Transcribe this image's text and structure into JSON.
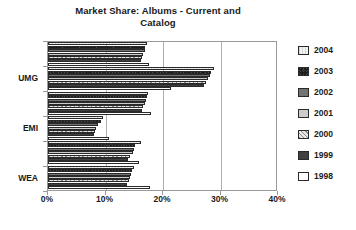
{
  "chart_data": {
    "type": "bar",
    "orientation": "horizontal",
    "title": "Market Share: Albums - Current and Catalog",
    "title_line1": "Market Share: Albums - Current and",
    "title_line2": "Catalog",
    "xlabel": "",
    "ylabel": "",
    "xlim": [
      0,
      40
    ],
    "xticks": [
      0,
      10,
      20,
      30,
      40
    ],
    "xticklabels": [
      "0%",
      "10%",
      "20%",
      "30%",
      "40%"
    ],
    "grid": true,
    "legend_position": "right",
    "categories": [
      "",
      "UMG",
      "",
      "EMI",
      "",
      "WEA"
    ],
    "visible_category_labels": [
      "UMG",
      "EMI",
      "WEA"
    ],
    "series": [
      {
        "name": "2004",
        "values": [
          17.2,
          28.9,
          17.4,
          9.6,
          16.1,
          14.9
        ]
      },
      {
        "name": "2003",
        "values": [
          16.9,
          28.3,
          17.3,
          9.2,
          15.2,
          14.6
        ]
      },
      {
        "name": "2002",
        "values": [
          16.8,
          28.1,
          17.1,
          8.7,
          15.0,
          14.4
        ]
      },
      {
        "name": "2001",
        "values": [
          16.6,
          27.9,
          16.8,
          8.4,
          14.7,
          14.2
        ]
      },
      {
        "name": "2000",
        "values": [
          16.4,
          27.5,
          16.6,
          8.2,
          14.3,
          14.0
        ]
      },
      {
        "name": "1999",
        "values": [
          16.1,
          27.2,
          16.3,
          8.0,
          13.9,
          13.8
        ]
      },
      {
        "name": "1998",
        "values": [
          17.6,
          21.4,
          17.9,
          10.6,
          15.8,
          17.8
        ]
      }
    ]
  },
  "legend": {
    "items": [
      {
        "label": "2004",
        "swatch": "swatch-2004"
      },
      {
        "label": "2003",
        "swatch": "swatch-2003"
      },
      {
        "label": "2002",
        "swatch": "swatch-2002"
      },
      {
        "label": "2001",
        "swatch": "swatch-2001"
      },
      {
        "label": "2000",
        "swatch": "swatch-2000"
      },
      {
        "label": "1999",
        "swatch": "swatch-1999"
      },
      {
        "label": "1998",
        "swatch": "swatch-1998"
      }
    ]
  },
  "colors": {
    "frame": "#9a9a9a",
    "grid": "#b0b0b0",
    "text": "#1a1a1a",
    "background": "#ffffff"
  }
}
